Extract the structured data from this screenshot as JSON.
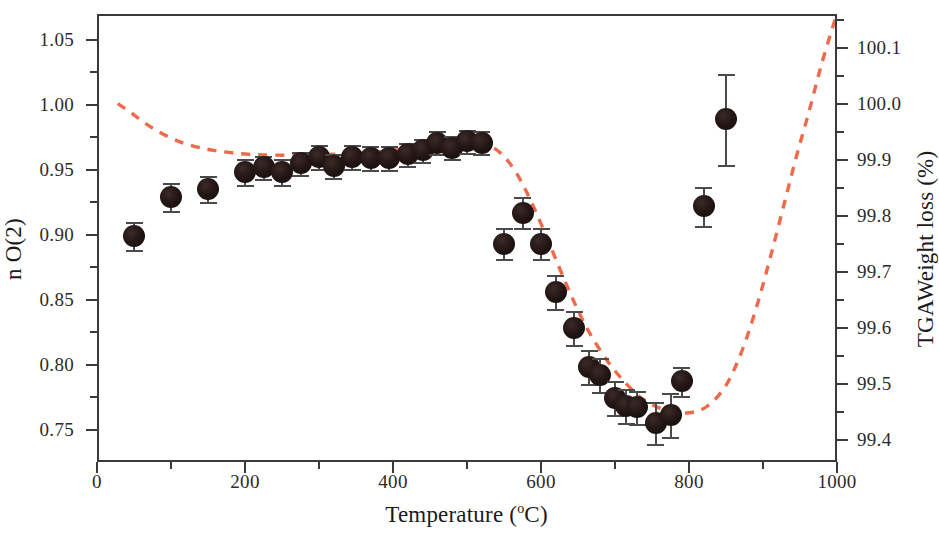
{
  "chart_data": {
    "type": "scatter",
    "title": "",
    "xlabel": "Temperature (°C)",
    "ylabel": "n O(2)",
    "y2label": "TGA Weight loss (%)",
    "xlim": [
      0,
      1000
    ],
    "ylim": [
      0.725,
      1.07
    ],
    "y2lim": [
      99.36,
      100.16
    ],
    "grid": false,
    "legend": "none",
    "x_ticks": [
      0,
      200,
      400,
      600,
      800,
      1000
    ],
    "x_tick_labels": [
      "0",
      "200",
      "400",
      "600",
      "800",
      "1000"
    ],
    "x_minor_ticks": [
      100,
      300,
      500,
      700,
      900
    ],
    "y_ticks": [
      0.75,
      0.8,
      0.85,
      0.9,
      0.95,
      1.0,
      1.05
    ],
    "y_tick_labels": [
      "0.75",
      "0.80",
      "0.85",
      "0.90",
      "0.95",
      "1.00",
      "1.05"
    ],
    "y_minor_ticks": [
      0.775,
      0.825,
      0.875,
      0.925,
      0.975,
      1.025
    ],
    "y2_ticks": [
      99.4,
      99.5,
      99.6,
      99.7,
      99.8,
      99.9,
      100.0,
      100.1
    ],
    "y2_tick_labels": [
      "99.4",
      "99.5",
      "99.6",
      "99.7",
      "99.8",
      "99.9",
      "100.0",
      "100.1"
    ],
    "y2_minor_ticks": [
      99.45,
      99.55,
      99.65,
      99.75,
      99.85,
      99.95,
      100.05,
      100.15
    ],
    "series": [
      {
        "name": "n O(2)",
        "type": "scatter",
        "marker": "filled-circle",
        "color": "#1b0f0d",
        "axis": "left",
        "points": [
          {
            "x": 50,
            "y": 0.899,
            "err": 0.011
          },
          {
            "x": 100,
            "y": 0.929,
            "err": 0.011
          },
          {
            "x": 150,
            "y": 0.935,
            "err": 0.01
          },
          {
            "x": 200,
            "y": 0.948,
            "err": 0.01
          },
          {
            "x": 225,
            "y": 0.952,
            "err": 0.009
          },
          {
            "x": 250,
            "y": 0.948,
            "err": 0.01
          },
          {
            "x": 275,
            "y": 0.955,
            "err": 0.009
          },
          {
            "x": 300,
            "y": 0.96,
            "err": 0.009
          },
          {
            "x": 320,
            "y": 0.953,
            "err": 0.009
          },
          {
            "x": 345,
            "y": 0.96,
            "err": 0.009
          },
          {
            "x": 370,
            "y": 0.959,
            "err": 0.009
          },
          {
            "x": 395,
            "y": 0.959,
            "err": 0.009
          },
          {
            "x": 420,
            "y": 0.962,
            "err": 0.009
          },
          {
            "x": 440,
            "y": 0.965,
            "err": 0.009
          },
          {
            "x": 460,
            "y": 0.971,
            "err": 0.009
          },
          {
            "x": 480,
            "y": 0.967,
            "err": 0.009
          },
          {
            "x": 500,
            "y": 0.972,
            "err": 0.009
          },
          {
            "x": 520,
            "y": 0.971,
            "err": 0.009
          },
          {
            "x": 550,
            "y": 0.893,
            "err": 0.012
          },
          {
            "x": 575,
            "y": 0.917,
            "err": 0.012
          },
          {
            "x": 600,
            "y": 0.893,
            "err": 0.012
          },
          {
            "x": 620,
            "y": 0.856,
            "err": 0.013
          },
          {
            "x": 645,
            "y": 0.828,
            "err": 0.013
          },
          {
            "x": 665,
            "y": 0.798,
            "err": 0.013
          },
          {
            "x": 680,
            "y": 0.792,
            "err": 0.013
          },
          {
            "x": 700,
            "y": 0.774,
            "err": 0.013
          },
          {
            "x": 715,
            "y": 0.768,
            "err": 0.013
          },
          {
            "x": 730,
            "y": 0.767,
            "err": 0.013
          },
          {
            "x": 755,
            "y": 0.755,
            "err": 0.016
          },
          {
            "x": 775,
            "y": 0.761,
            "err": 0.017
          },
          {
            "x": 790,
            "y": 0.787,
            "err": 0.011
          },
          {
            "x": 820,
            "y": 0.922,
            "err": 0.015
          },
          {
            "x": 850,
            "y": 0.989,
            "err": 0.035
          }
        ]
      },
      {
        "name": "TGA Weight loss (%)",
        "type": "line",
        "style": "dashed",
        "color": "#ef6a4a",
        "axis": "right",
        "points": [
          {
            "x": 28,
            "y2": 100.0
          },
          {
            "x": 45,
            "y2": 99.985
          },
          {
            "x": 65,
            "y2": 99.965
          },
          {
            "x": 90,
            "y2": 99.945
          },
          {
            "x": 120,
            "y2": 99.928
          },
          {
            "x": 160,
            "y2": 99.916
          },
          {
            "x": 210,
            "y2": 99.909
          },
          {
            "x": 270,
            "y2": 99.908
          },
          {
            "x": 330,
            "y2": 99.91
          },
          {
            "x": 390,
            "y2": 99.915
          },
          {
            "x": 440,
            "y2": 99.924
          },
          {
            "x": 480,
            "y2": 99.932
          },
          {
            "x": 505,
            "y2": 99.933
          },
          {
            "x": 525,
            "y2": 99.928
          },
          {
            "x": 545,
            "y2": 99.912
          },
          {
            "x": 565,
            "y2": 99.88
          },
          {
            "x": 585,
            "y2": 99.83
          },
          {
            "x": 605,
            "y2": 99.77
          },
          {
            "x": 625,
            "y2": 99.706
          },
          {
            "x": 645,
            "y2": 99.645
          },
          {
            "x": 665,
            "y2": 99.592
          },
          {
            "x": 690,
            "y2": 99.54
          },
          {
            "x": 715,
            "y2": 99.5
          },
          {
            "x": 740,
            "y2": 99.47
          },
          {
            "x": 770,
            "y2": 99.452
          },
          {
            "x": 800,
            "y2": 99.448
          },
          {
            "x": 825,
            "y2": 99.46
          },
          {
            "x": 850,
            "y2": 99.497
          },
          {
            "x": 872,
            "y2": 99.56
          },
          {
            "x": 892,
            "y2": 99.64
          },
          {
            "x": 910,
            "y2": 99.726
          },
          {
            "x": 928,
            "y2": 99.818
          },
          {
            "x": 945,
            "y2": 99.905
          },
          {
            "x": 962,
            "y2": 99.985
          },
          {
            "x": 978,
            "y2": 100.065
          },
          {
            "x": 995,
            "y2": 100.14
          },
          {
            "x": 1000,
            "y2": 100.158
          }
        ]
      }
    ]
  },
  "figure": {
    "x_axis_title": "Temperature (",
    "x_axis_title_sup": "o",
    "x_axis_title_tail": "C)",
    "y_axis_title": "n O(2)",
    "y2_axis_title": "TGAWeight loss (%)"
  },
  "colors": {
    "axis": "#3a3a3a",
    "marker": "#1b0f0d",
    "tga_curve": "#ef6a4a",
    "text": "#1a1a1a",
    "background": "#ffffff"
  }
}
